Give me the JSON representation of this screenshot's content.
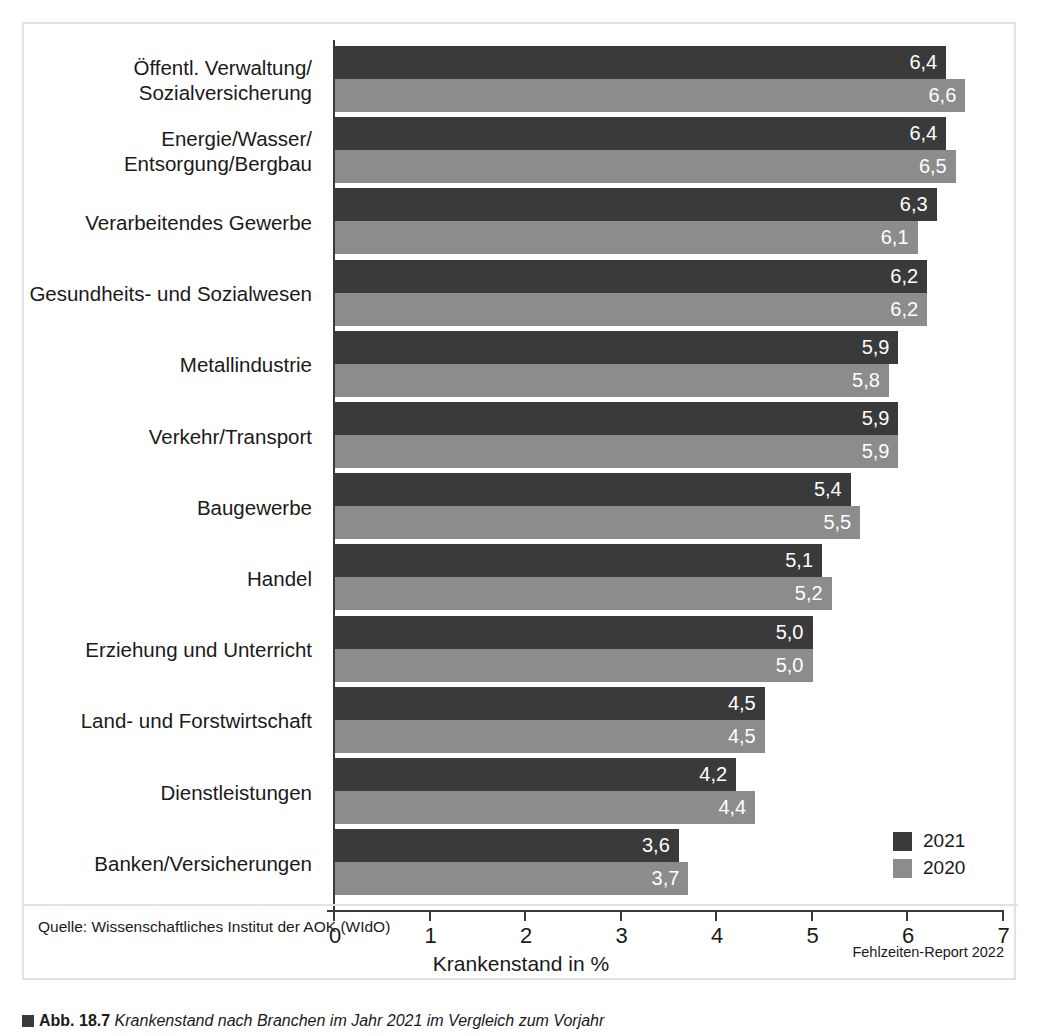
{
  "figure": {
    "source_note": "Quelle: Wissenschaftliches Institut der AOK (WIdO)",
    "report_note": "Fehlzeiten-Report 2022",
    "caption_marker": "square-marker",
    "caption_number": "Abb. 18.7",
    "caption_text": "Krankenstand nach Branchen im Jahr 2021 im Vergleich zum Vorjahr"
  },
  "legend": {
    "position": "bottom-right",
    "items": [
      {
        "label": "2021",
        "color": "#3a3a3a",
        "swatch": "dark"
      },
      {
        "label": "2020",
        "color": "#8c8c8c",
        "swatch": "light"
      }
    ]
  },
  "chart_data": {
    "type": "bar",
    "orientation": "horizontal",
    "title": "",
    "xlabel": "Krankenstand in %",
    "ylabel": "",
    "xlim": [
      0,
      7
    ],
    "xticks": [
      0,
      1,
      2,
      3,
      4,
      5,
      6,
      7
    ],
    "xtick_labels": [
      "0",
      "1",
      "2",
      "3",
      "4",
      "5",
      "6",
      "7"
    ],
    "grid": false,
    "value_decimal_separator": ",",
    "categories": [
      "Öffentl. Verwaltung/\nSozialversicherung",
      "Energie/Wasser/\nEntsorgung/Bergbau",
      "Verarbeitendes Gewerbe",
      "Gesundheits- und Sozialwesen",
      "Metallindustrie",
      "Verkehr/Transport",
      "Baugewerbe",
      "Handel",
      "Erziehung und Unterricht",
      "Land- und Forstwirtschaft",
      "Dienstleistungen",
      "Banken/Versicherungen"
    ],
    "series": [
      {
        "name": "2021",
        "color": "#3a3a3a",
        "values": [
          6.4,
          6.4,
          6.3,
          6.2,
          5.9,
          5.9,
          5.4,
          5.1,
          5.0,
          4.5,
          4.2,
          3.6
        ],
        "labels": [
          "6,4",
          "6,4",
          "6,3",
          "6,2",
          "5,9",
          "5,9",
          "5,4",
          "5,1",
          "5,0",
          "4,5",
          "4,2",
          "3,6"
        ]
      },
      {
        "name": "2020",
        "color": "#8c8c8c",
        "values": [
          6.6,
          6.5,
          6.1,
          6.2,
          5.8,
          5.9,
          5.5,
          5.2,
          5.0,
          4.5,
          4.4,
          3.7
        ],
        "labels": [
          "6,6",
          "6,5",
          "6,1",
          "6,2",
          "5,8",
          "5,9",
          "5,5",
          "5,2",
          "5,0",
          "4,5",
          "4,4",
          "3,7"
        ]
      }
    ]
  }
}
